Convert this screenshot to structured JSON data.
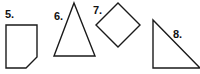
{
  "page": {
    "background_color": "#ffffff",
    "stroke_color": "#1a1a1a",
    "label_color": "#111111",
    "width": 200,
    "height": 74
  },
  "figures": [
    {
      "number": "5.",
      "name": "pentagon",
      "description": "Square with bottom-right corner cut off (pentagon)",
      "label_x": 5,
      "label_y": 18,
      "points": "6,25 37,25 37,57 26,68 6,68"
    },
    {
      "number": "6.",
      "name": "isosceles-triangle",
      "description": "Tall isosceles triangle pointing up",
      "label_x": 54,
      "label_y": 20,
      "points": "74,3 95,56 54,56"
    },
    {
      "number": "7.",
      "name": "rhombus",
      "description": "Diamond / rotated square",
      "label_x": 93,
      "label_y": 14,
      "points": "118,3 140,25 118,47 96,25"
    },
    {
      "number": "8.",
      "name": "right-triangle",
      "description": "Right triangle with right angle at bottom left",
      "label_x": 173,
      "label_y": 38,
      "points": "153,20 153,68 200,68"
    }
  ]
}
